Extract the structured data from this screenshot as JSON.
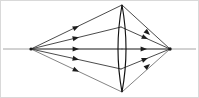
{
  "figure": {
    "kind": "optics-ray-diagram",
    "width": 199,
    "height": 98,
    "background_color": "#ffffff"
  },
  "colors": {
    "axis": "#9a9a9a",
    "ray": "#2b2b2b",
    "ray_faint": "#636363",
    "lens_outline": "#111111",
    "arrow_fill": "#1d1d1d",
    "node": "#1a1a1a",
    "frame": "#d9d9d9"
  },
  "optical_axis": {
    "label": "optical axis",
    "x1": 3,
    "y1": 49,
    "x2": 196,
    "y2": 49,
    "stroke_width": 0.9
  },
  "lens": {
    "label": "biconvex converging lens",
    "type": "biconvex",
    "center_x": 122,
    "center_y": 49,
    "top_y": 5,
    "bottom_y": 92,
    "half_thickness": 8,
    "left_surface_path": "M 122 5 Q 114 49 122 92",
    "right_surface_path": "M 122 5 Q 130 49 122 92"
  },
  "object_point": {
    "label": "object point source",
    "x": 31,
    "y": 49,
    "radius": 1.6
  },
  "image_point": {
    "label": "image convergence point",
    "x": 170,
    "y": 49,
    "radius": 1.7
  },
  "rays": [
    {
      "id": "ray-top-edge",
      "label": "ray to upper lens apex",
      "incident": {
        "x1": 31,
        "y1": 49,
        "x2": 122,
        "y2": 5
      },
      "refracted": {
        "x1": 122,
        "y1": 5,
        "x2": 170,
        "y2": 49
      },
      "incident_arrow": {
        "x": 79,
        "y": 26,
        "angle": -25.8
      },
      "refracted_arrow": {
        "x": 150,
        "y": 35,
        "angle": 42.5
      },
      "style": "ray"
    },
    {
      "id": "ray-upper",
      "label": "upper intermediate ray",
      "incident": {
        "x1": 31,
        "y1": 49,
        "x2": 121,
        "y2": 27
      },
      "refracted": {
        "x1": 121,
        "y1": 27,
        "x2": 170,
        "y2": 49
      },
      "incident_arrow": {
        "x": 79,
        "y": 37.2,
        "angle": -13.7
      },
      "refracted_arrow": {
        "x": 148,
        "y": 39.1,
        "angle": 24.2
      },
      "style": "ray"
    },
    {
      "id": "ray-axial",
      "label": "axial ray along optical axis",
      "incident": {
        "x1": 31,
        "y1": 49,
        "x2": 122,
        "y2": 49
      },
      "refracted": {
        "x1": 122,
        "y1": 49,
        "x2": 170,
        "y2": 49
      },
      "incident_arrow": {
        "x": 79,
        "y": 49,
        "angle": 0
      },
      "refracted_arrow": {
        "x": 147,
        "y": 49,
        "angle": 0
      },
      "style": "ray"
    },
    {
      "id": "ray-lower",
      "label": "lower intermediate ray",
      "incident": {
        "x1": 31,
        "y1": 49,
        "x2": 121,
        "y2": 69
      },
      "refracted": {
        "x1": 121,
        "y1": 69,
        "x2": 170,
        "y2": 49
      },
      "incident_arrow": {
        "x": 79,
        "y": 59.7,
        "angle": 12.5
      },
      "refracted_arrow": {
        "x": 148,
        "y": 58.0,
        "angle": -22.2
      },
      "style": "ray"
    },
    {
      "id": "ray-bottom-edge",
      "label": "ray to lower lens apex",
      "incident": {
        "x1": 31,
        "y1": 49,
        "x2": 122,
        "y2": 92
      },
      "refracted": {
        "x1": 122,
        "y1": 92,
        "x2": 170,
        "y2": 49
      },
      "incident_arrow": {
        "x": 79,
        "y": 71.7,
        "angle": 25.3
      },
      "refracted_arrow": {
        "x": 150,
        "y": 63.9,
        "angle": -41.9
      },
      "style": "ray-faint"
    }
  ],
  "arrow_geometry": {
    "length": 6.4,
    "half_width": 2.5
  }
}
